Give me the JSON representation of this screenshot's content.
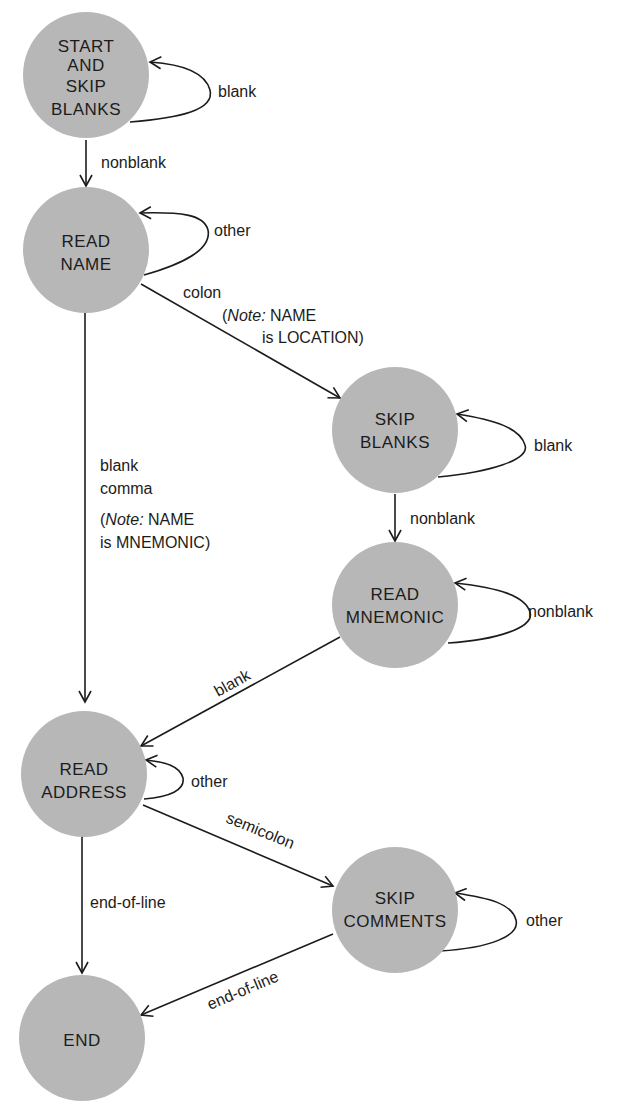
{
  "diagram": {
    "type": "state-machine",
    "colors": {
      "node_fill": "#b7b7b7",
      "line": "#1c1c1c",
      "background": "#ffffff"
    },
    "nodes": [
      {
        "id": "start",
        "lines": [
          "START",
          "AND",
          "SKIP",
          "BLANKS"
        ]
      },
      {
        "id": "read_name",
        "lines": [
          "READ",
          "NAME"
        ]
      },
      {
        "id": "skip_blanks",
        "lines": [
          "SKIP",
          "BLANKS"
        ]
      },
      {
        "id": "read_mnemonic",
        "lines": [
          "READ",
          "MNEMONIC"
        ]
      },
      {
        "id": "read_address",
        "lines": [
          "READ",
          "ADDRESS"
        ]
      },
      {
        "id": "skip_comments",
        "lines": [
          "SKIP",
          "COMMENTS"
        ]
      },
      {
        "id": "end",
        "lines": [
          "END"
        ]
      }
    ],
    "edges": [
      {
        "from": "start",
        "to": "start",
        "label": "blank"
      },
      {
        "from": "start",
        "to": "read_name",
        "label": "nonblank"
      },
      {
        "from": "read_name",
        "to": "read_name",
        "label": "other"
      },
      {
        "from": "read_name",
        "to": "skip_blanks",
        "label": "colon",
        "note_prefix": "Note:",
        "note_line1": "NAME",
        "note_line2": "is LOCATION)"
      },
      {
        "from": "skip_blanks",
        "to": "skip_blanks",
        "label": "blank"
      },
      {
        "from": "skip_blanks",
        "to": "read_mnemonic",
        "label": "nonblank"
      },
      {
        "from": "read_mnemonic",
        "to": "read_mnemonic",
        "label": "nonblank"
      },
      {
        "from": "read_name",
        "to": "read_address",
        "label_line1": "blank",
        "label_line2": "comma",
        "note_prefix": "Note:",
        "note_line1": "NAME",
        "note_line2": "is MNEMONIC)"
      },
      {
        "from": "read_mnemonic",
        "to": "read_address",
        "label": "blank"
      },
      {
        "from": "read_address",
        "to": "read_address",
        "label": "other"
      },
      {
        "from": "read_address",
        "to": "skip_comments",
        "label": "semicolon"
      },
      {
        "from": "read_address",
        "to": "end",
        "label": "end-of-line"
      },
      {
        "from": "skip_comments",
        "to": "skip_comments",
        "label": "other"
      },
      {
        "from": "skip_comments",
        "to": "end",
        "label": "end-of-line"
      }
    ]
  }
}
